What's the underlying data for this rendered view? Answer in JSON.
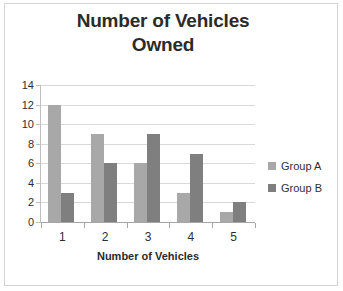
{
  "chart_data": {
    "type": "bar",
    "title": "Number of Vehicles Owned",
    "title_line1": "Number of Vehicles",
    "title_line2": "Owned",
    "xlabel": "Number of Vehicles",
    "ylabel": "",
    "categories": [
      "1",
      "2",
      "3",
      "4",
      "5"
    ],
    "series": [
      {
        "name": "Group A",
        "color": "#a8a8a8",
        "values": [
          12,
          9,
          6,
          3,
          1
        ]
      },
      {
        "name": "Group B",
        "color": "#7f7f7f",
        "values": [
          3,
          6,
          9,
          7,
          2
        ]
      }
    ],
    "ylim": [
      0,
      14
    ],
    "ytick_labels": [
      "14",
      "12",
      "10",
      "8",
      "6",
      "4",
      "2",
      "0"
    ],
    "ytick_values": [
      14,
      12,
      10,
      8,
      6,
      4,
      2,
      0
    ],
    "grid": true,
    "grid_axis": "y",
    "legend_position": "right",
    "background": "#ffffff",
    "border_color": "#d4d4d4",
    "gridline_color": "#d9d9d9",
    "text_color": "#2b2b2b"
  },
  "legend": {
    "items": [
      {
        "label": "Group A",
        "color": "#a8a8a8"
      },
      {
        "label": "Group B",
        "color": "#7f7f7f"
      }
    ]
  }
}
